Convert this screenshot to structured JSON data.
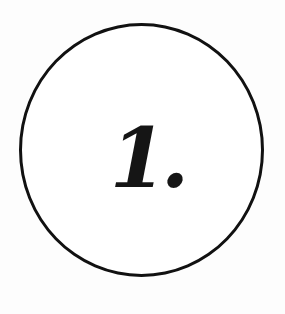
{
  "badge": {
    "label": "1.",
    "stroke_color": "#111111",
    "fill_color": "#ffffff",
    "text_color": "#151515"
  }
}
